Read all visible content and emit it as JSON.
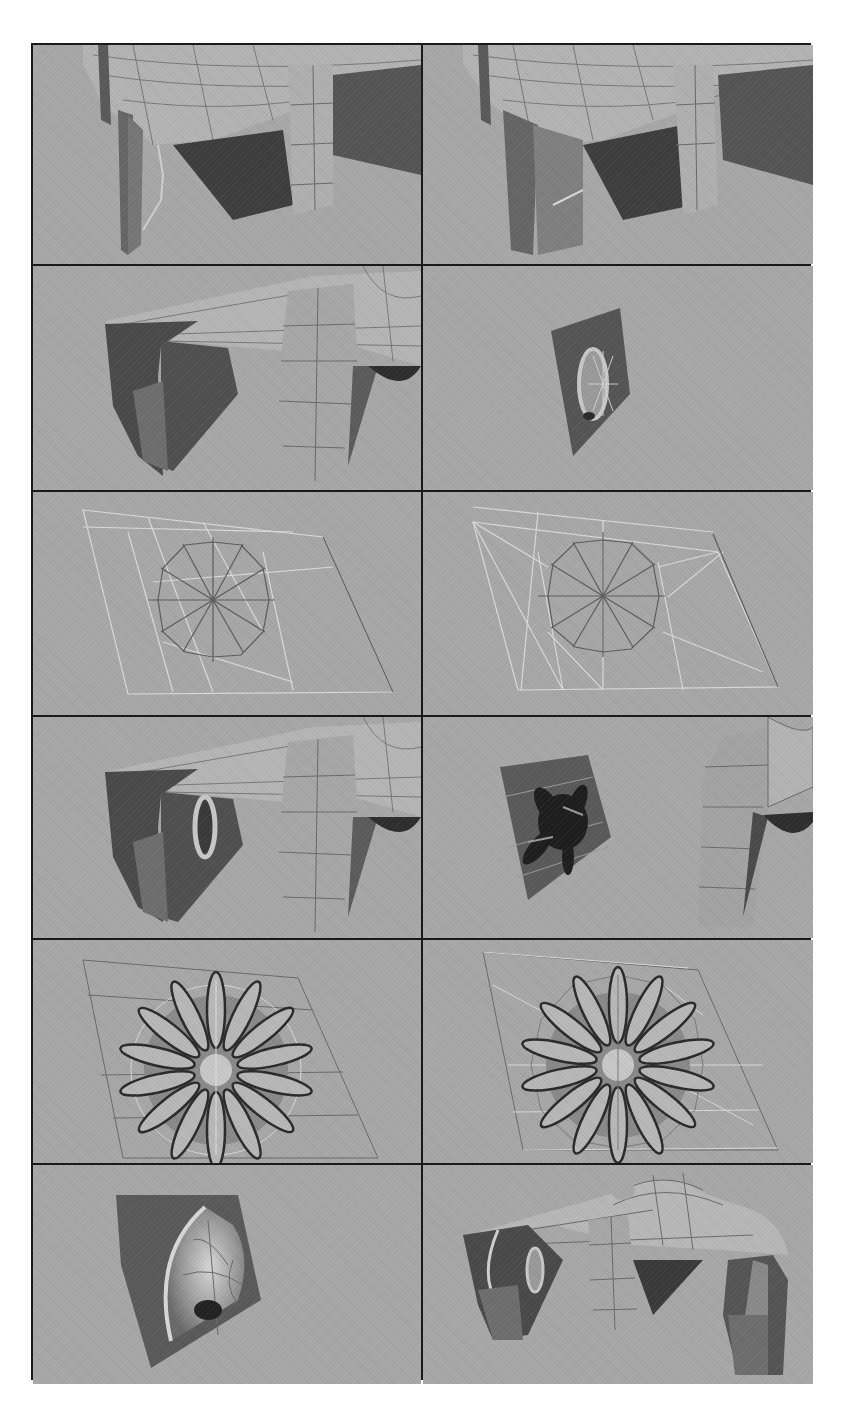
{
  "figure": {
    "layout": {
      "rows": 6,
      "columns": 2
    },
    "colors": {
      "viewport_bg": "#a8a8a8",
      "border": "#1a1a1a",
      "surface_light": "#b8b8b8",
      "surface_mid": "#8a8a8a",
      "surface_dark": "#4a4a4a",
      "wire_dark": "#5a5a5a",
      "wire_light": "#dcdcdc"
    },
    "panels": [
      {
        "id": "r1c1",
        "content": "Close-up of ship underside with engine pod wireframe and a thin strip edge being extruded"
      },
      {
        "id": "r1c2",
        "content": "Same view with extruded inner wall panel completed"
      },
      {
        "id": "r2c1",
        "content": "Shaded view of left engine pod and central vertical fin under the wing"
      },
      {
        "id": "r2c2",
        "content": "Isolated dark quad panel with circular intake ring and radial spokes"
      },
      {
        "id": "r3c1",
        "content": "Wireframe of 12-segment circle with radial edges inside a quad, light triangulation lines"
      },
      {
        "id": "r3c2",
        "content": "Same circle wireframe with additional triangulated connecting edges"
      },
      {
        "id": "r4c1",
        "content": "Shaded ship with circular intake ring inserted in engine pod"
      },
      {
        "id": "r4c2",
        "content": "Isolated panel showing dark fan blade cluster beside fin"
      },
      {
        "id": "r5c1",
        "content": "Front view of 14-blade fan with hub inside a quad grid"
      },
      {
        "id": "r5c2",
        "content": "Fan with blades over triangulated quad wireframe"
      },
      {
        "id": "r6c1",
        "content": "Isolated curved intake cone with rim, shaded"
      },
      {
        "id": "r6c2",
        "content": "Full ship front three-quarter view with both engine pods and dome"
      }
    ]
  }
}
